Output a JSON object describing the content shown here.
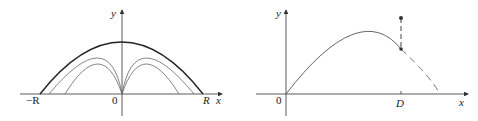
{
  "figures": [
    {
      "id": "left",
      "description": "Projectile trajectories from origin with envelope (parabola of safety)",
      "axis_labels": {
        "x": "x",
        "y": "y"
      },
      "tick_labels": {
        "neg_R": "−R",
        "origin": "0",
        "R": "R"
      },
      "curves": [
        "envelope",
        "trajectory-1",
        "trajectory-2",
        "trajectory-3",
        "trajectory-4"
      ]
    },
    {
      "id": "right",
      "description": "Projectile trajectory with target at distance D",
      "axis_labels": {
        "x": "x",
        "y": "y"
      },
      "tick_labels": {
        "origin": "0",
        "D": "D"
      },
      "curves": [
        "trajectory-solid",
        "trajectory-dashed",
        "vertical-dashed-segment"
      ]
    }
  ],
  "colors": {
    "axis": "#333333",
    "curve": "#555555",
    "envelope": "#222222"
  }
}
